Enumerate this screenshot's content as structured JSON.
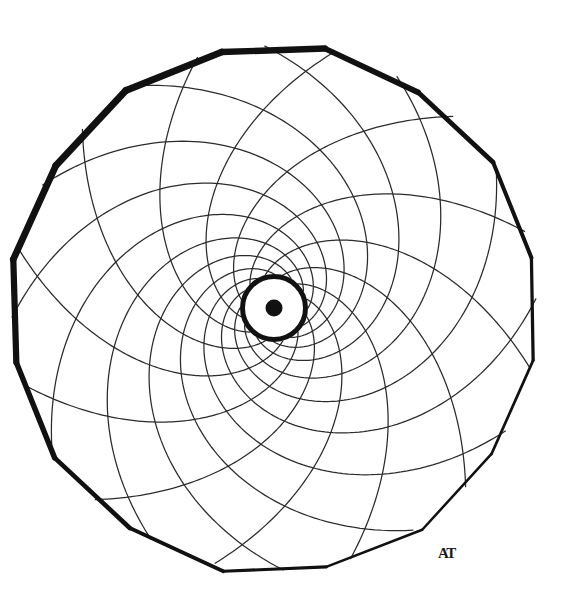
{
  "artwork": {
    "title": "Spiral Lattice Mandala",
    "medium": "ink-on-paper-line-drawing",
    "background_color": "#ffffff",
    "ink_color": "#141414",
    "thin_line_color": "#2b2b2b",
    "canvas": {
      "width": 575,
      "height": 615
    }
  },
  "outer_boundary": {
    "name": "polygonal-rim",
    "shape": "polygon",
    "sides": 16,
    "center_x": 274,
    "center_y": 310,
    "radius": 264,
    "stroke_color": "#111111",
    "stroke_width_max": 7,
    "stroke_width_min": 2.5,
    "rotation_deg": 11,
    "radius_jitter": [
      1.0,
      0.988,
      1.004,
      0.993,
      1.008,
      0.99,
      1.002,
      0.996,
      1.006,
      0.991,
      1.003,
      0.997,
      1.009,
      0.989,
      1.001,
      0.995
    ]
  },
  "hub": {
    "name": "central-hub-ring",
    "center_x": 274,
    "center_y": 308,
    "outer_radius": 34,
    "ring_thickness": 5,
    "ring_color": "#111111",
    "fill_color": "#ffffff"
  },
  "center_dot": {
    "name": "center-dot",
    "center_x": 274,
    "center_y": 308,
    "radius": 8.5,
    "color": "#111111"
  },
  "spirals": {
    "family_count": 2,
    "arms_per_family": 12,
    "inner_radius": 34,
    "outer_radius": 262,
    "stroke_color": "#2b2b2b",
    "stroke_width": 1.25,
    "clockwise": {
      "name": "clockwise-spiral-family",
      "direction": -1,
      "total_turn_deg": 212,
      "arms": 12,
      "phase_offset_deg": 0
    },
    "counterclockwise": {
      "name": "counterclockwise-spiral-family",
      "direction": 1,
      "total_turn_deg": 118,
      "arms": 12,
      "phase_offset_deg": 15
    }
  },
  "signature": {
    "name": "artist-signature",
    "text": "AT",
    "x": 438,
    "y": 558,
    "color": "#1a1a1a"
  },
  "chart_data": {
    "type": "scatter",
    "xlabel": "",
    "ylabel": "",
    "categories": [
      "clockwise-arms",
      "counterclockwise-arms",
      "rim-sides",
      "hub-rings",
      "center-dots"
    ],
    "values": [
      12,
      12,
      16,
      1,
      1
    ],
    "legend": [
      "clockwise spiral family",
      "counterclockwise spiral family",
      "polygonal rim",
      "hub ring",
      "center dot"
    ],
    "grid": false,
    "legend_position": "none"
  }
}
